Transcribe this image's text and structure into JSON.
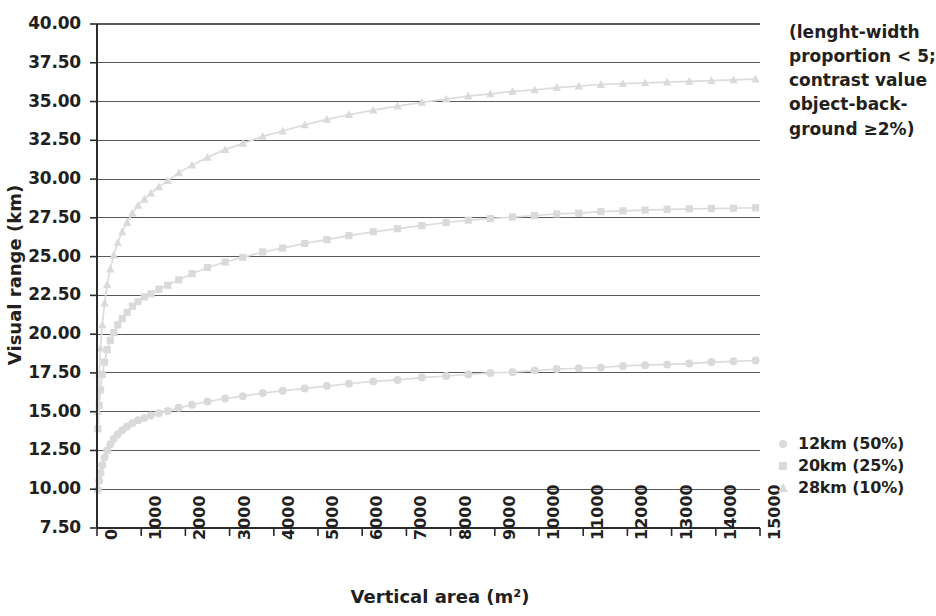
{
  "chart_data": {
    "type": "line",
    "title": "",
    "xlabel": "Vertical area (m²)",
    "ylabel": "Visual range (km)",
    "xlim": [
      0,
      15000
    ],
    "ylim": [
      7.5,
      40.0
    ],
    "grid": true,
    "legend_position": "right",
    "x_ticks": [
      "0",
      "1000",
      "2000",
      "3000",
      "4000",
      "5000",
      "6000",
      "7000",
      "8000",
      "9000",
      "10000",
      "11000",
      "12000",
      "13000",
      "14000",
      "15000"
    ],
    "y_ticks": [
      "7.50",
      "10.00",
      "12.50",
      "15.00",
      "17.50",
      "20.00",
      "22.50",
      "25.00",
      "27.50",
      "30.00",
      "32.50",
      "35.00",
      "37.50",
      "40.00"
    ],
    "annotation": [
      "(lenght-width",
      "proportion < 5;",
      "contrast value",
      "object-back-",
      "ground ≥2%)"
    ],
    "series": [
      {
        "name": "12km (50%)",
        "marker": "circle",
        "color": "#dadada",
        "x": [
          20,
          50,
          80,
          120,
          170,
          230,
          300,
          380,
          470,
          570,
          680,
          800,
          930,
          1070,
          1220,
          1400,
          1600,
          1850,
          2150,
          2500,
          2900,
          3300,
          3750,
          4200,
          4700,
          5200,
          5700,
          6250,
          6800,
          7350,
          7900,
          8400,
          8900,
          9400,
          9900,
          10400,
          10900,
          11400,
          11900,
          12400,
          12900,
          13400,
          13900,
          14400,
          14900
        ],
        "y": [
          9.95,
          10.55,
          11.05,
          11.55,
          12.05,
          12.5,
          12.9,
          13.25,
          13.55,
          13.8,
          14.05,
          14.25,
          14.45,
          14.6,
          14.75,
          14.9,
          15.05,
          15.25,
          15.45,
          15.65,
          15.85,
          16.0,
          16.2,
          16.35,
          16.5,
          16.65,
          16.8,
          16.95,
          17.05,
          17.2,
          17.3,
          17.4,
          17.5,
          17.55,
          17.65,
          17.75,
          17.8,
          17.85,
          17.95,
          18.0,
          18.05,
          18.1,
          18.2,
          18.25,
          18.3
        ]
      },
      {
        "name": "20km (25%)",
        "marker": "square",
        "color": "#dadada",
        "x": [
          20,
          50,
          80,
          120,
          170,
          230,
          300,
          380,
          470,
          570,
          680,
          800,
          930,
          1070,
          1220,
          1400,
          1600,
          1850,
          2150,
          2500,
          2900,
          3300,
          3750,
          4200,
          4700,
          5200,
          5700,
          6250,
          6800,
          7350,
          7900,
          8400,
          8900,
          9400,
          9900,
          10400,
          10900,
          11400,
          11900,
          12400,
          12900,
          13400,
          13900,
          14400,
          14900
        ],
        "y": [
          13.9,
          15.4,
          16.4,
          17.4,
          18.2,
          19.0,
          19.6,
          20.1,
          20.6,
          21.0,
          21.4,
          21.8,
          22.1,
          22.4,
          22.6,
          22.9,
          23.15,
          23.5,
          23.9,
          24.3,
          24.65,
          24.95,
          25.3,
          25.55,
          25.85,
          26.1,
          26.35,
          26.6,
          26.8,
          27.0,
          27.2,
          27.35,
          27.45,
          27.55,
          27.65,
          27.75,
          27.8,
          27.9,
          27.95,
          28.0,
          28.05,
          28.08,
          28.1,
          28.12,
          28.15
        ]
      },
      {
        "name": "28km (10%)",
        "marker": "triangle",
        "color": "#dadada",
        "x": [
          20,
          50,
          80,
          120,
          170,
          230,
          300,
          380,
          470,
          570,
          680,
          800,
          930,
          1070,
          1220,
          1400,
          1600,
          1850,
          2150,
          2500,
          2900,
          3300,
          3750,
          4200,
          4700,
          5200,
          5700,
          6250,
          6800,
          7350,
          7900,
          8400,
          8900,
          9400,
          9900,
          10400,
          10900,
          11400,
          11900,
          12400,
          12900,
          13400,
          13900,
          14400,
          14900
        ],
        "y": [
          15.0,
          17.4,
          19.1,
          20.6,
          22.0,
          23.2,
          24.2,
          25.1,
          25.9,
          26.6,
          27.2,
          27.8,
          28.3,
          28.7,
          29.1,
          29.5,
          29.9,
          30.4,
          30.9,
          31.4,
          31.9,
          32.3,
          32.75,
          33.1,
          33.5,
          33.85,
          34.15,
          34.45,
          34.7,
          34.95,
          35.15,
          35.35,
          35.5,
          35.65,
          35.75,
          35.9,
          36.0,
          36.1,
          36.15,
          36.2,
          36.25,
          36.3,
          36.35,
          36.4,
          36.45
        ]
      }
    ]
  },
  "legend": {
    "items": [
      {
        "label": "12km (50%)",
        "marker": "circle"
      },
      {
        "label": "20km (25%)",
        "marker": "square"
      },
      {
        "label": "28km (10%)",
        "marker": "triangle"
      }
    ]
  }
}
